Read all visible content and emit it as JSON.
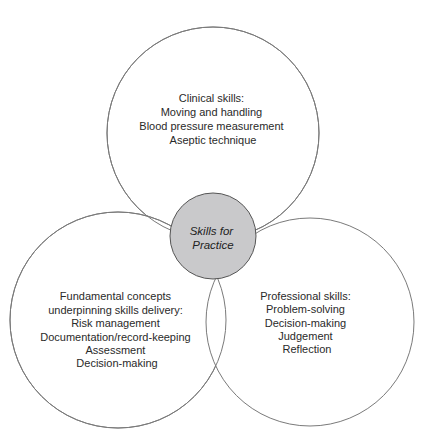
{
  "diagram": {
    "center": {
      "lines": [
        "Skills for",
        "Practice"
      ],
      "fill": "#c9c9cb"
    },
    "circles": [
      {
        "id": "clinical",
        "lines": [
          "Clinical skills:",
          "Moving and handling",
          "Blood pressure measurement",
          "Aseptic technique"
        ]
      },
      {
        "id": "fundamental",
        "lines": [
          "Fundamental concepts",
          "underpinning skills delivery:",
          "Risk management",
          "Documentation/record-keeping",
          "Assessment",
          "Decision-making"
        ]
      },
      {
        "id": "professional",
        "lines": [
          "Professional skills:",
          "Problem-solving",
          "Decision-making",
          "Judgement",
          "Reflection"
        ]
      }
    ],
    "stroke": "#7a7a7a"
  }
}
